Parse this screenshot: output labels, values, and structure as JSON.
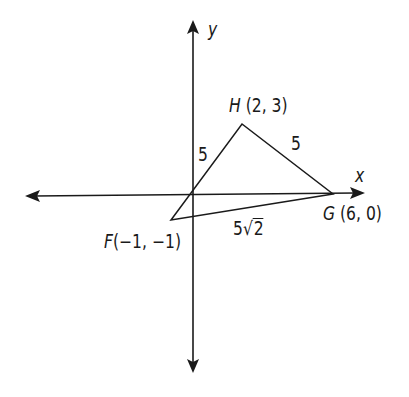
{
  "diagram": {
    "type": "coordinate-plane-triangle",
    "axes": {
      "x_label": "x",
      "y_label": "y"
    },
    "points": [
      {
        "name": "H",
        "label": "H (2, 3)",
        "coords": [
          2,
          3
        ]
      },
      {
        "name": "G",
        "label": "G (6, 0)",
        "coords": [
          6,
          0
        ]
      },
      {
        "name": "F",
        "label": "F(−1, −1)",
        "coords": [
          -1,
          -1
        ]
      }
    ],
    "sides": [
      {
        "segment": "FH",
        "length_label": "5"
      },
      {
        "segment": "HG",
        "length_label": "5"
      },
      {
        "segment": "FG",
        "length_label_coef": "5",
        "length_label_radicand": "2"
      }
    ],
    "labels": {
      "H": {
        "letter": "H",
        "coords": "(2, 3)"
      },
      "G": {
        "letter": "G",
        "coords": "(6, 0)"
      },
      "F": {
        "letter": "F",
        "coords": "(−1, −1)"
      }
    },
    "stroke_color": "#1a1a1a",
    "background_color": "#ffffff"
  }
}
